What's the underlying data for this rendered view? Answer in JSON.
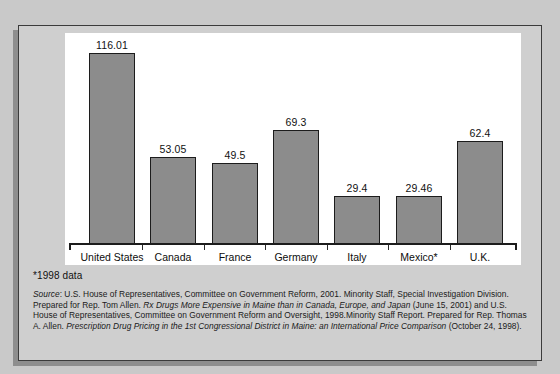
{
  "figure": {
    "footnote": "*1998 data",
    "source_label": "Source",
    "source_parts": {
      "p1": ": U.S. House of Representatives, Committee on Government Reform, 2001. Minority Staff, Special Investigation Division. Prepared for Rep. Tom Allen. ",
      "title1": "Rx Drugs More Expensive in Maine than in Canada, Europe, and Japan",
      "p2": " (June 15, 2001) and U.S. House of Representatives, Committee on Government Reform and Oversight, 1998.Minority Staff Report. Prepared for Rep. Thomas A. Allen. ",
      "title2": "Prescription Drug Pricing in the 1st Congressional District in Maine: an International Price Comparison",
      "p3": " (October 24, 1998)."
    }
  },
  "colors": {
    "bar_fill": "#8c8c8c",
    "bar_stroke": "#1c1c1c",
    "plot_background": "#ffffff",
    "card_background": "#cfcfcf",
    "page_background": "#c9c9c9",
    "text": "#111111"
  },
  "chart_data": {
    "type": "bar",
    "title": "",
    "xlabel": "",
    "ylabel": "",
    "grid": false,
    "legend": "none",
    "ylim": [
      0,
      125
    ],
    "categories": [
      "United States",
      "Canada",
      "France",
      "Germany",
      "Italy",
      "Mexico*",
      "U.K."
    ],
    "values": [
      116.01,
      53.05,
      49.5,
      69.3,
      29.4,
      29.46,
      62.4
    ],
    "value_labels": [
      "116.01",
      "53.05",
      "49.5",
      "69.3",
      "29.4",
      "29.46",
      "62.4"
    ]
  }
}
